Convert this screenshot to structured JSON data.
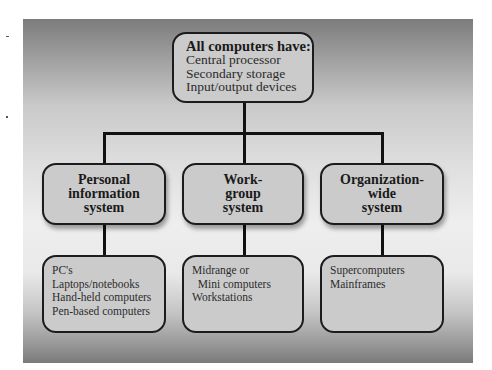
{
  "diagram": {
    "root": {
      "title": "All computers have:",
      "items": [
        "Central processor",
        "Secondary storage",
        "Input/output devices"
      ]
    },
    "categories": [
      {
        "title_lines": [
          "Personal",
          "information",
          "system"
        ],
        "examples": [
          "PC's",
          "Laptops/notebooks",
          "Hand-held computers",
          "Pen-based computers"
        ]
      },
      {
        "title_lines": [
          "Work-",
          "group",
          "system"
        ],
        "examples": [
          "Midrange or",
          "  Mini computers",
          "Workstations"
        ]
      },
      {
        "title_lines": [
          "Organization-",
          "wide",
          "system"
        ],
        "examples": [
          "Supercomputers",
          "Mainframes"
        ]
      }
    ]
  },
  "colors": {
    "box_fill": "#cbcbcb",
    "box_border": "#1c1c1c",
    "connector": "#111111",
    "background_dark": "#7a7a7a",
    "background_light": "#eeeeee"
  }
}
